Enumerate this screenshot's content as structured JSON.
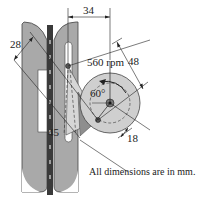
{
  "diagram": {
    "speed_label": "560 rpm",
    "angle_label": "60°",
    "dimensions": {
      "top": "34",
      "right": "48",
      "left": "28",
      "bottom_left": "45",
      "bottom_right": "18"
    },
    "note": "All dimensions are in mm.",
    "colors": {
      "plate_gray": "#a9a9a9",
      "disk_gray": "#cfcfcf",
      "arm_light": "#d6d6d6",
      "arm_dark": "#8e8e8e",
      "rail_dark": "#3a3a3a",
      "line": "#222222"
    }
  }
}
